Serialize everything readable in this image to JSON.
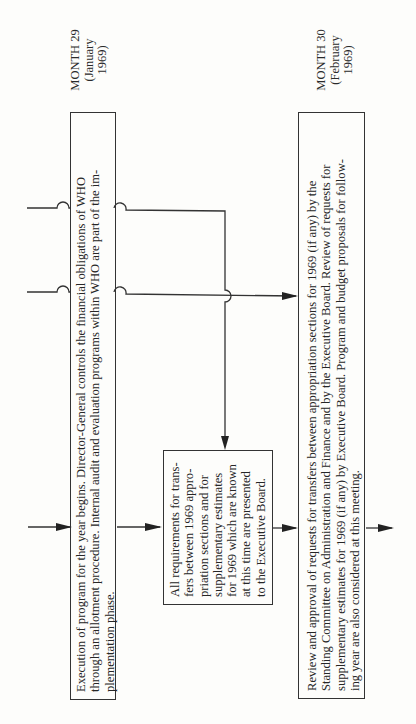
{
  "diagram": {
    "orientation": "rotated-90-ccw",
    "months": [
      {
        "label": "MONTH 29",
        "sub": "(January",
        "year": "1969)"
      },
      {
        "label": "MONTH 30",
        "sub": "(February",
        "year": "1969)"
      }
    ],
    "boxes": [
      {
        "id": "execution",
        "lines": [
          "Execution of program for the year begins. Director-General controls the financial obligations of WHO",
          "through an allotment procedure. Internal audit and evaluation programs within WHO are part of the im-",
          "plementation phase."
        ]
      },
      {
        "id": "requirements",
        "lines": [
          "All requirements for trans-",
          "fers between 1969 appro-",
          "priation sections and for",
          "supplementary estimates",
          "for 1969 which are known",
          "at this time are presented",
          "to the Executive Board."
        ]
      },
      {
        "id": "review",
        "lines": [
          "Review and approval of requests for transfers between appropriation sections for 1969 (if any) by the",
          "Standing Committee on Administration and Finance and by the Executive Board. Review of requests for",
          "supplementary estimates for 1969 (if any) by Executive Board. Program and budget proposals for follow-",
          "ing year are also considered at this meeting."
        ]
      }
    ],
    "connectors": [
      {
        "from": "input",
        "to": "execution",
        "type": "arrow"
      },
      {
        "from": "execution",
        "to": "requirements",
        "type": "arrow"
      },
      {
        "from": "requirements",
        "to": "review",
        "type": "arrow"
      },
      {
        "from": "review",
        "to": "output",
        "type": "arrow"
      },
      {
        "from": "incoming-line-upper",
        "to": "requirements",
        "type": "arrow",
        "note": "crosses execution box with hop"
      },
      {
        "from": "incoming-line-lower",
        "to": "review",
        "type": "arrow",
        "note": "crosses execution box and vertical line with hops"
      }
    ],
    "colors": {
      "line": "#333333",
      "background": "#fdfdfb",
      "text": "#262626"
    }
  }
}
